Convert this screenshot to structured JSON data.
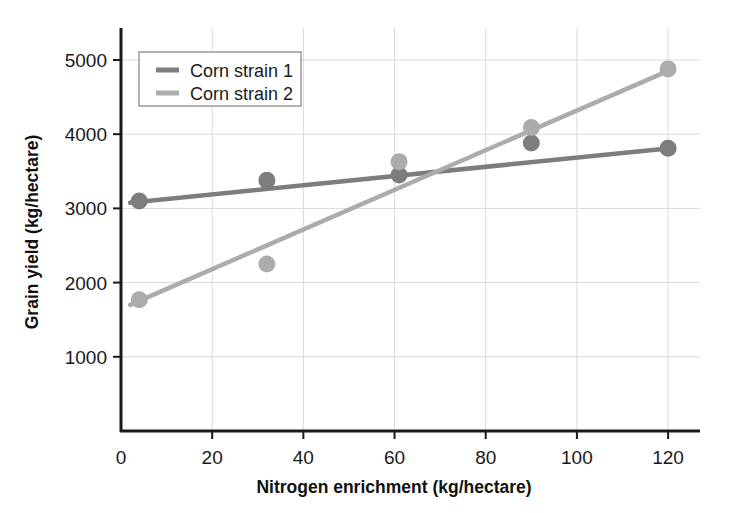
{
  "chart_data": {
    "type": "scatter",
    "title": "",
    "xlabel": "Nitrogen enrichment (kg/hectare)",
    "ylabel": "Grain yield (kg/hectare)",
    "xlim": [
      0,
      127
    ],
    "ylim": [
      0,
      5350
    ],
    "xticks": [
      0,
      20,
      40,
      60,
      80,
      100,
      120
    ],
    "yticks": [
      1000,
      2000,
      3000,
      4000,
      5000
    ],
    "xtick_labels": [
      "0",
      "20",
      "40",
      "60",
      "80",
      "100",
      "120"
    ],
    "ytick_labels": [
      "1000",
      "2000",
      "3000",
      "4000",
      "5000"
    ],
    "grid": true,
    "grid_color": "#d9d9d9",
    "legend_position": "top-left",
    "series": [
      {
        "name": "Corn strain 1",
        "color": "#7d7d7d",
        "marker": "circle",
        "points": [
          {
            "x": 4,
            "y": 3100
          },
          {
            "x": 32,
            "y": 3380
          },
          {
            "x": 61,
            "y": 3450
          },
          {
            "x": 90,
            "y": 3880
          },
          {
            "x": 120,
            "y": 3810
          }
        ],
        "trendline": {
          "x0": 2,
          "y0": 3075,
          "x1": 121,
          "y1": 3815
        }
      },
      {
        "name": "Corn strain 2",
        "color": "#acacac",
        "marker": "circle",
        "points": [
          {
            "x": 4,
            "y": 1770
          },
          {
            "x": 32,
            "y": 2250
          },
          {
            "x": 61,
            "y": 3630
          },
          {
            "x": 90,
            "y": 4090
          },
          {
            "x": 120,
            "y": 4880
          }
        ],
        "trendline": {
          "x0": 2,
          "y0": 1700,
          "x1": 121,
          "y1": 4880
        }
      }
    ]
  },
  "legend": {
    "items": [
      {
        "label": "Corn strain 1",
        "color": "#7d7d7d"
      },
      {
        "label": "Corn strain 2",
        "color": "#acacac"
      }
    ]
  },
  "axes": {
    "x_title": "Nitrogen enrichment (kg/hectare)",
    "y_title": "Grain yield (kg/hectare)"
  }
}
